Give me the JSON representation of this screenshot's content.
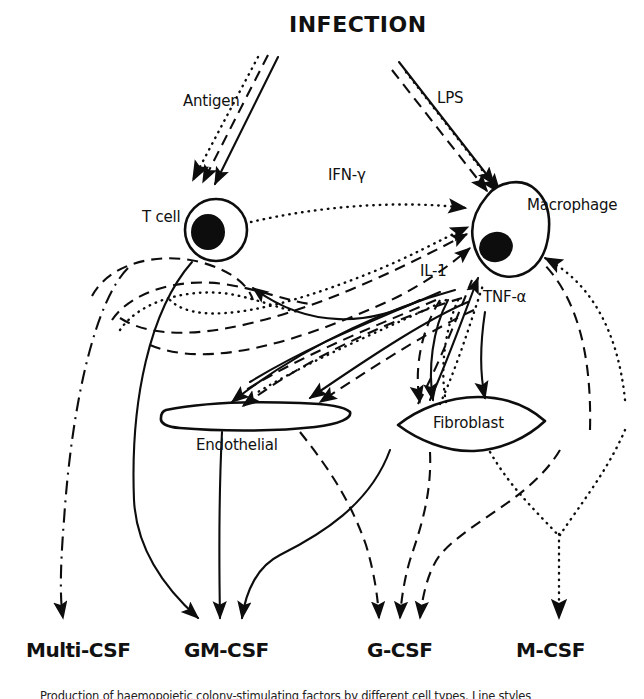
{
  "figure": {
    "title": "INFECTION",
    "domain": "biology-signalling-diagram"
  },
  "stimuli": [
    {
      "id": "antigen",
      "label": "Antigen",
      "target": "T cell",
      "x": 183,
      "y": 92
    },
    {
      "id": "lps",
      "label": "LPS",
      "target": "Macrophage",
      "x": 437,
      "y": 89
    }
  ],
  "cells": [
    {
      "id": "tcell",
      "label": "T cell",
      "x": 142,
      "y": 208,
      "shape": "round-nucleated"
    },
    {
      "id": "macrophage",
      "label": "Macrophage",
      "x": 527,
      "y": 196,
      "shape": "amoeboid-nucleated"
    },
    {
      "id": "endothelial",
      "label": "Endothelial",
      "x": 196,
      "y": 436,
      "shape": "flat-elongated"
    },
    {
      "id": "fibroblast",
      "label": "Fibroblast",
      "x": 433,
      "y": 421,
      "shape": "spindle"
    }
  ],
  "mediators": [
    {
      "id": "ifng",
      "label": "IFN-γ",
      "from": "T cell",
      "to": "Macrophage",
      "x": 328,
      "y": 172,
      "line": "dotted"
    },
    {
      "id": "il1",
      "label": "IL-1",
      "from": "Macrophage",
      "to": "multiple",
      "x": 420,
      "y": 269,
      "line": "mixed"
    },
    {
      "id": "tnfa",
      "label": "TNF-α",
      "from": "Macrophage",
      "to": "multiple",
      "x": 483,
      "y": 293,
      "line": "mixed"
    }
  ],
  "outputs": [
    {
      "id": "multi-csf",
      "label": "Multi-CSF",
      "x": 26,
      "y": 640,
      "arrow_count": 1,
      "sources": [
        "T cell"
      ]
    },
    {
      "id": "gm-csf",
      "label": "GM-CSF",
      "x": 184,
      "y": 640,
      "arrow_count": 3,
      "sources": [
        "T cell",
        "Endothelial",
        "Fibroblast"
      ]
    },
    {
      "id": "g-csf",
      "label": "G-CSF",
      "x": 367,
      "y": 640,
      "arrow_count": 3,
      "sources": [
        "Endothelial",
        "Fibroblast",
        "Macrophage"
      ]
    },
    {
      "id": "m-csf",
      "label": "M-CSF",
      "x": 516,
      "y": 640,
      "arrow_count": 1,
      "sources": [
        "Fibroblast"
      ]
    }
  ],
  "caption": {
    "text": "Production of haemopoietic colony-stimulating factors by different cell types. Line styles"
  },
  "line_styles": [
    {
      "id": "solid",
      "meaning": "CSF production"
    },
    {
      "id": "dashed",
      "meaning": "mediator action"
    },
    {
      "id": "dotted",
      "meaning": "cytokine signal"
    },
    {
      "id": "dash-dot",
      "meaning": "Multi-CSF pathway"
    }
  ],
  "colors": {
    "ink": "#0d0d0d",
    "background": "#ffffff"
  }
}
